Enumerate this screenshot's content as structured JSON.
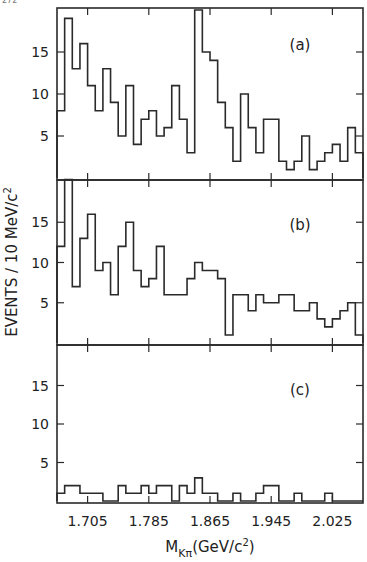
{
  "chart_data": {
    "type": "bar",
    "subtype": "histogram-step",
    "title": "",
    "xlabel": "M_{Kπ} (GeV/c²)",
    "xlabel_main": "M",
    "xlabel_sub": "Kπ",
    "xlabel_unit": "(GeV/c",
    "xlabel_sup": "2",
    "xlabel_close": ")",
    "ylabel": "EVENTS / 10 MeV/c²",
    "ylabel_main": "EVENTS / 10 MeV/c",
    "ylabel_sup": "2",
    "bin_width": 0.01,
    "x_start": 1.665,
    "xlim": [
      1.665,
      2.065
    ],
    "ylim": [
      0,
      20
    ],
    "x_ticks": [
      1.705,
      1.785,
      1.865,
      1.945,
      2.025
    ],
    "x_tick_labels": [
      "1.705",
      "1.785",
      "1.865",
      "1.945",
      "2.025"
    ],
    "y_ticks": [
      5,
      10,
      15
    ],
    "y_tick_labels": [
      "5",
      "10",
      "15"
    ],
    "grid": false,
    "legend": null,
    "panels": [
      {
        "label": "(a)",
        "values": [
          8,
          19,
          13,
          16,
          11,
          8,
          13,
          9,
          5,
          11,
          4,
          7,
          8,
          5,
          6,
          11,
          7,
          3,
          20,
          15,
          14,
          9,
          6,
          2,
          10,
          6,
          3,
          7,
          7,
          2,
          1,
          2,
          5,
          1,
          2,
          3,
          4,
          2,
          6,
          3
        ]
      },
      {
        "label": "(b)",
        "values": [
          12,
          21,
          7,
          13,
          16,
          9,
          10,
          6,
          12,
          15,
          9,
          7,
          8,
          12,
          6,
          6,
          6,
          8,
          10,
          9,
          9,
          8,
          1,
          6,
          6,
          4,
          6,
          5,
          5,
          6,
          6,
          4,
          4,
          5,
          3,
          2,
          3,
          4,
          5,
          1
        ]
      },
      {
        "label": "(c)",
        "values": [
          1,
          2,
          2,
          1,
          1,
          1,
          0,
          0,
          2,
          1,
          1,
          2,
          1,
          2,
          2,
          0,
          2,
          1,
          3,
          1,
          1,
          0,
          0,
          1,
          0,
          0,
          1,
          2,
          2,
          0,
          0,
          1,
          0,
          0,
          0,
          1,
          0,
          0,
          0,
          0
        ]
      }
    ]
  },
  "corner_mark": "272"
}
